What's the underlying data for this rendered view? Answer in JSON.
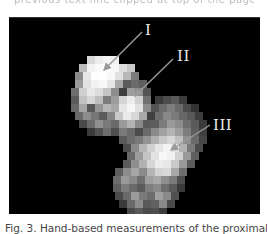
{
  "header": {
    "clipped_text": "previous text line clipped at top of the page"
  },
  "figure": {
    "type": "grayscale pixelated bone image (proximal femur)",
    "background": "#000000",
    "labels": [
      {
        "id": "I",
        "text": "I",
        "target": "femoral head"
      },
      {
        "id": "II",
        "text": "II",
        "target": "femoral neck"
      },
      {
        "id": "III",
        "text": "III",
        "target": "trochanteric region"
      }
    ],
    "arrow_color": "#9a9a9a",
    "label_color": "#e8e8e8"
  },
  "caption": {
    "text": "Fig. 3. Hand-based measurements of the proximal"
  }
}
